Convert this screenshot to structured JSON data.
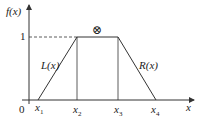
{
  "diagram": {
    "type": "trapezoidal membership function",
    "y_axis_label": "f(x)",
    "x_axis_label": "x",
    "origin_label": "0",
    "level_label": "1",
    "left_curve_label": "L(x)",
    "right_curve_label": "R(x)",
    "top_symbol": "⊗",
    "x_ticks": [
      {
        "name": "x",
        "sub": "1"
      },
      {
        "name": "x",
        "sub": "2"
      },
      {
        "name": "x",
        "sub": "3"
      },
      {
        "name": "x",
        "sub": "4"
      }
    ],
    "colors": {
      "line": "#333333",
      "background": "#ffffff"
    }
  }
}
